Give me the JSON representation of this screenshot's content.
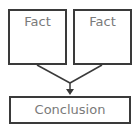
{
  "diagram": {
    "premises": [
      {
        "label": "Fact"
      },
      {
        "label": "Fact"
      }
    ],
    "conclusion": {
      "label": "Conclusion"
    },
    "colors": {
      "border": "#3a3a3a",
      "text": "#7a7a7a",
      "connector": "#3a3a3a"
    }
  }
}
